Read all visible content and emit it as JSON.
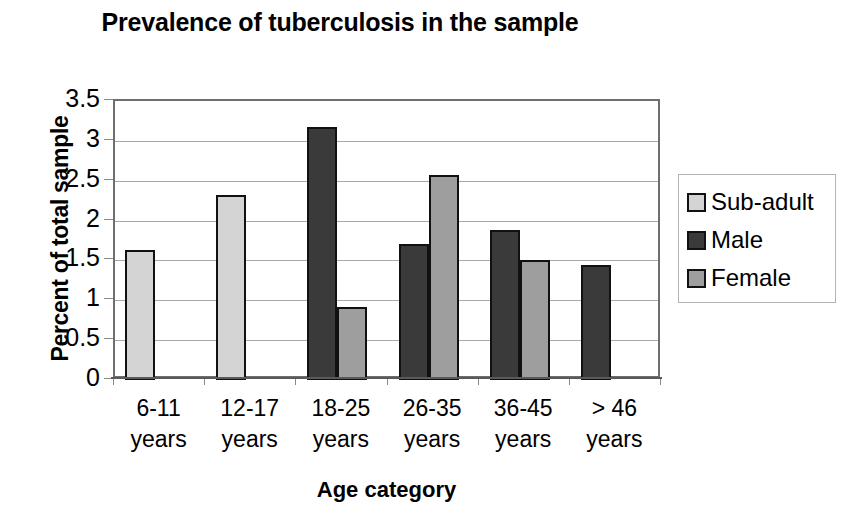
{
  "chart_data": {
    "type": "bar",
    "title": "Prevalence of tuberculosis in the sample",
    "xlabel": "Age category",
    "ylabel": "Percent of total sample",
    "categories": [
      "6-11 years",
      "12-17 years",
      "18-25 years",
      "26-35 years",
      "36-45 years",
      "> 46 years"
    ],
    "category_lines": [
      [
        "6-11",
        "years"
      ],
      [
        "12-17",
        "years"
      ],
      [
        "18-25",
        "years"
      ],
      [
        "26-35",
        "years"
      ],
      [
        "36-45",
        "years"
      ],
      [
        "> 46",
        "years"
      ]
    ],
    "series": [
      {
        "name": "Sub-adult",
        "color": "#d4d4d4",
        "values": [
          1.63,
          2.32,
          null,
          null,
          null,
          null
        ]
      },
      {
        "name": "Male",
        "color": "#3a3a3a",
        "values": [
          null,
          null,
          3.18,
          1.7,
          1.88,
          1.44
        ]
      },
      {
        "name": "Female",
        "color": "#9e9e9e",
        "values": [
          null,
          null,
          0.92,
          2.57,
          1.51,
          null
        ]
      }
    ],
    "ylim": [
      0,
      3.5
    ],
    "yticks": [
      0,
      0.5,
      1,
      1.5,
      2,
      2.5,
      3,
      3.5
    ],
    "ytick_labels": [
      "0",
      "0.5",
      "1",
      "1.5",
      "2",
      "2.5",
      "3",
      "3.5"
    ],
    "grid": true,
    "legend_position": "right",
    "legend_entries": [
      "Sub-adult",
      "Male",
      "Female"
    ]
  }
}
